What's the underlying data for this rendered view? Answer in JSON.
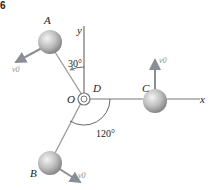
{
  "figure": {
    "number_fragment": "6",
    "points": {
      "A": "A",
      "B": "B",
      "C": "C",
      "D": "D",
      "O": "O"
    },
    "axes": {
      "x": "x",
      "y": "y"
    },
    "angles": {
      "a_to_y": "30°",
      "b_to_x": "120°"
    },
    "velocity_label": "v0",
    "colors": {
      "line": "#8a8f96",
      "ball_light": "#f2f2f2",
      "ball_dark": "#8c8c8c",
      "text": "#222222"
    }
  }
}
